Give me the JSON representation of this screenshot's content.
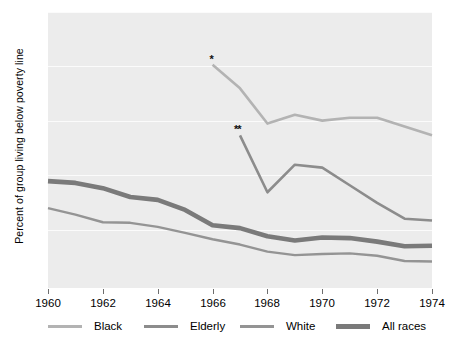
{
  "chart_data": {
    "type": "line",
    "title": "",
    "subtitle": "",
    "xlabel": "",
    "ylabel": "Percent of group living below poverty line",
    "xlim": [
      1960,
      1974
    ],
    "ylim": [
      4,
      51
    ],
    "grid": true,
    "legend_position": "bottom",
    "x_ticks": [
      "1960",
      "1962",
      "1964",
      "1966",
      "1968",
      "1970",
      "1972",
      "1974"
    ],
    "x_tick_values": [
      1960,
      1962,
      1964,
      1966,
      1968,
      1970,
      1972,
      1974
    ],
    "y_ticks": [
      "10",
      "20",
      "30",
      "40",
      "50"
    ],
    "y_tick_values": [
      10,
      20,
      30,
      40,
      50
    ],
    "series": [
      {
        "name": "Black",
        "color": "#b3b3b3",
        "width": 2.6,
        "note": "*",
        "x": [
          1966,
          1967,
          1968,
          1969,
          1970,
          1971,
          1972,
          1973,
          1974
        ],
        "values": [
          42.0,
          38.0,
          32.0,
          33.5,
          32.5,
          33.0,
          33.0,
          31.5,
          30.0
        ]
      },
      {
        "name": "Elderly",
        "color": "#8c8c8c",
        "width": 2.6,
        "note": "**",
        "x": [
          1967,
          1968,
          1969,
          1970,
          1971,
          1972,
          1973,
          1974
        ],
        "values": [
          30.0,
          20.3,
          25.0,
          24.5,
          21.5,
          18.5,
          15.8,
          15.5
        ]
      },
      {
        "name": "White",
        "color": "#949494",
        "width": 2.4,
        "note": "",
        "x": [
          1960,
          1961,
          1962,
          1963,
          1964,
          1965,
          1966,
          1967,
          1968,
          1969,
          1970,
          1971,
          1972,
          1973,
          1974
        ],
        "values": [
          17.6,
          16.5,
          15.2,
          15.1,
          14.4,
          13.4,
          12.3,
          11.4,
          10.2,
          9.6,
          9.8,
          9.9,
          9.5,
          8.6,
          8.5
        ]
      },
      {
        "name": "All races",
        "color": "#7a7a7a",
        "width": 4.6,
        "note": "",
        "x": [
          1960,
          1961,
          1962,
          1963,
          1964,
          1965,
          1966,
          1967,
          1968,
          1969,
          1970,
          1971,
          1972,
          1973,
          1974
        ],
        "values": [
          22.2,
          21.9,
          21.0,
          19.5,
          19.0,
          17.3,
          14.7,
          14.2,
          12.8,
          12.1,
          12.6,
          12.5,
          11.9,
          11.1,
          11.2
        ]
      }
    ],
    "annotations": [
      {
        "text": "*",
        "series": "Black",
        "x": 1966,
        "y": 42.0
      },
      {
        "text": "**",
        "series": "Elderly",
        "x": 1967,
        "y": 30.0
      }
    ]
  },
  "axes": {
    "y_title": "Percent of group living below poverty line",
    "y_labels": [
      "50",
      "40",
      "30",
      "20",
      "10"
    ],
    "x_labels": [
      "1960",
      "1962",
      "1964",
      "1966",
      "1968",
      "1970",
      "1972",
      "1974"
    ]
  },
  "legend": {
    "items": [
      {
        "label": "Black",
        "color": "#b3b3b3",
        "thickness": "3px"
      },
      {
        "label": "Elderly",
        "color": "#8c8c8c",
        "thickness": "3px"
      },
      {
        "label": "White",
        "color": "#949494",
        "thickness": "3px"
      },
      {
        "label": "All races",
        "color": "#7a7a7a",
        "thickness": "5px"
      }
    ]
  },
  "colors": {
    "plot_background": "#ececec",
    "gridline": "#fbfbfb",
    "page_background": "#ffffff",
    "text": "#000000",
    "tickmark": "#6d6d6d"
  }
}
